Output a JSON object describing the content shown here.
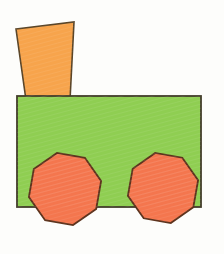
{
  "figure": {
    "background": "#fdfdfb",
    "canvas": {
      "width": "224",
      "height": "254"
    },
    "texture": {
      "stripe_color": "#ffffff",
      "angle_deg": "75"
    },
    "shapes": {
      "chimney": {
        "kind": "trapezoid",
        "fill": "#f7a44c",
        "stroke": "#5a4528",
        "stroke_width": "1.6",
        "points": "16,29 74,22 70,100 26,100"
      },
      "body": {
        "kind": "rectangle",
        "fill": "#8fce52",
        "stroke": "#433d2b",
        "stroke_width": "1.8",
        "x": "17",
        "y": "96",
        "width": "184",
        "height": "111"
      },
      "left_wheel": {
        "kind": "octagon",
        "fill": "#f4764e",
        "stroke": "#5d331d",
        "stroke_width": "1.8",
        "points": "96.2,208.9 73.0,225.1 45.1,220.2 28.9,197.0 33.8,169.1 57.0,152.9 84.9,157.8 101.1,181.0"
      },
      "right_wheel": {
        "kind": "octagon",
        "fill": "#f4764e",
        "stroke": "#5d331d",
        "stroke_width": "1.8",
        "points": "193.3,207.3 170.8,223.1 143.7,218.3 127.9,195.8 132.7,168.7 155.2,152.9 182.3,157.7 198.1,180.2"
      }
    }
  }
}
